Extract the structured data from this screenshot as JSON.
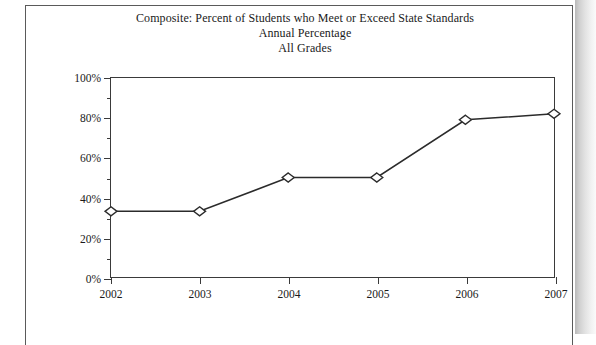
{
  "chart_data": {
    "type": "line",
    "title": "Composite: Percent of Students who Meet or Exceed State Standards",
    "subtitle": "Annual Percentage",
    "subtitle2": "All Grades",
    "xlabel": "",
    "ylabel": "",
    "categories": [
      "2002",
      "2003",
      "2004",
      "2005",
      "2006",
      "2007"
    ],
    "values": [
      33,
      33,
      50,
      50,
      79,
      82
    ],
    "x": [
      2002,
      2003,
      2004,
      2005,
      2006,
      2007
    ],
    "ylim": [
      0,
      100
    ],
    "xlim": [
      2002,
      2007
    ],
    "y_tick_labels": [
      "0%",
      "20%",
      "40%",
      "60%",
      "80%",
      "100%"
    ],
    "y_tick_values": [
      0,
      20,
      40,
      60,
      80,
      100
    ],
    "y_minor_tick_values": [
      10,
      30,
      50,
      70,
      90
    ],
    "grid": false,
    "legend": false,
    "marker": "open-diamond",
    "line_color": "#2b2b2b",
    "marker_fill": "#ffffff",
    "marker_stroke": "#2b2b2b"
  },
  "axis": {
    "frame_color": "#3a3a3a"
  }
}
